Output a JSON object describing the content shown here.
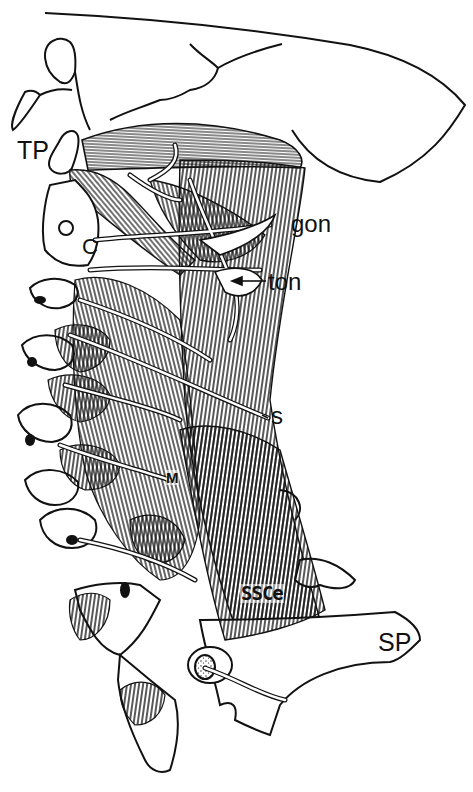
{
  "figure": {
    "colors": {
      "ink": "#111111",
      "paper": "#ffffff"
    },
    "labels": [
      {
        "id": "TP",
        "text": "TP",
        "x": 17,
        "y": 138
      },
      {
        "id": "C",
        "text": "C",
        "x": 82,
        "y": 236
      },
      {
        "id": "gon",
        "text": "gon",
        "x": 291,
        "y": 212
      },
      {
        "id": "ton",
        "text": "ton",
        "x": 268,
        "y": 272
      },
      {
        "id": "s",
        "text": "s",
        "x": 271,
        "y": 406
      },
      {
        "id": "M",
        "text": "M",
        "x": 166,
        "y": 470
      },
      {
        "id": "SSCe",
        "text": "SSCe",
        "x": 240,
        "y": 584
      },
      {
        "id": "SP",
        "text": "SP",
        "x": 378,
        "y": 630
      }
    ]
  }
}
